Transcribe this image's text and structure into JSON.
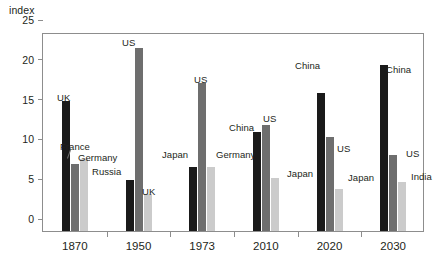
{
  "chart_data": {
    "type": "bar",
    "title": "",
    "xlabel": "",
    "ylabel": "index",
    "ylim": [
      0,
      25
    ],
    "yticks": [
      0,
      5,
      10,
      15,
      20,
      25
    ],
    "grid": false,
    "legend": "none (bars labelled in-place)",
    "categories": [
      "1870",
      "1950",
      "1973",
      "2010",
      "2020",
      "2030"
    ],
    "series": [
      {
        "name": "rank-1",
        "color": "#1a1a1a",
        "values": [
          16.3,
          6.4,
          8.0,
          12.5,
          17.3,
          20.9
        ],
        "labels": [
          "UK",
          "Russia",
          "Japan",
          "China",
          "China",
          "China"
        ]
      },
      {
        "name": "rank-2",
        "color": "#6e6e6e",
        "values": [
          8.4,
          23.0,
          18.6,
          13.3,
          11.8,
          9.5
        ],
        "labels": [
          "France",
          "US",
          "US",
          "US",
          "US",
          "US"
        ]
      },
      {
        "name": "rank-3",
        "color": "#cbcbcb",
        "values": [
          9.0,
          4.6,
          8.0,
          6.7,
          5.3,
          6.1
        ],
        "labels": [
          "Germany",
          "UK",
          "Germany",
          "Japan",
          "Japan",
          "India"
        ]
      }
    ]
  },
  "annotations": [
    {
      "text": "UK",
      "x": 57,
      "y": 92,
      "anchor": "start"
    },
    {
      "text": "France",
      "x": 60,
      "y": 141,
      "anchor": "start"
    },
    {
      "text": "Germany",
      "x": 78,
      "y": 152,
      "anchor": "start"
    },
    {
      "text": "US",
      "x": 122,
      "y": 37,
      "anchor": "start"
    },
    {
      "text": "Russia",
      "x": 92,
      "y": 166,
      "anchor": "start"
    },
    {
      "text": "UK",
      "x": 142,
      "y": 186,
      "anchor": "start"
    },
    {
      "text": "US",
      "x": 194,
      "y": 74,
      "anchor": "start"
    },
    {
      "text": "Japan",
      "x": 162,
      "y": 149,
      "anchor": "start"
    },
    {
      "text": "Germany",
      "x": 216,
      "y": 149,
      "anchor": "start"
    },
    {
      "text": "China",
      "x": 229,
      "y": 122,
      "anchor": "start"
    },
    {
      "text": "US",
      "x": 263,
      "y": 113,
      "anchor": "start"
    },
    {
      "text": "Japan",
      "x": 287,
      "y": 168,
      "anchor": "start"
    },
    {
      "text": "China",
      "x": 295,
      "y": 60,
      "anchor": "start"
    },
    {
      "text": "US",
      "x": 337,
      "y": 143,
      "anchor": "start"
    },
    {
      "text": "Japan",
      "x": 348,
      "y": 172,
      "anchor": "start"
    },
    {
      "text": "China",
      "x": 386,
      "y": 64,
      "anchor": "start"
    },
    {
      "text": "US",
      "x": 406,
      "y": 148,
      "anchor": "start"
    },
    {
      "text": "India",
      "x": 411,
      "y": 171,
      "anchor": "start"
    }
  ]
}
